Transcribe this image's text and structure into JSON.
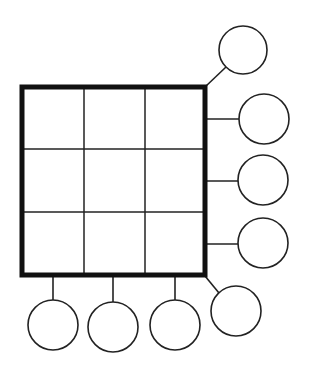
{
  "diagram": {
    "type": "magic-square-puzzle-template",
    "colors": {
      "background": "#ffffff",
      "stroke": "#222222",
      "border": "#111111"
    },
    "grid": {
      "rows": 3,
      "cols": 3,
      "x": 22,
      "y": 87,
      "width": 183,
      "height": 188,
      "border_width": 5,
      "line_width": 1.5,
      "col_lines_x": [
        84,
        145
      ],
      "row_lines_y": [
        149,
        212
      ],
      "cells": [
        [
          "",
          "",
          ""
        ],
        [
          "",
          "",
          ""
        ],
        [
          "",
          "",
          ""
        ]
      ]
    },
    "sum_circles": [
      {
        "id": "diagonal-top",
        "label": "",
        "cx": 243,
        "cy": 50,
        "r": 24,
        "connector": {
          "x1": 205,
          "y1": 87,
          "x2": 226,
          "y2": 67
        }
      },
      {
        "id": "row-1",
        "label": "",
        "cx": 264,
        "cy": 119,
        "r": 25,
        "connector": {
          "x1": 205,
          "y1": 119,
          "x2": 239,
          "y2": 119
        }
      },
      {
        "id": "row-2",
        "label": "",
        "cx": 263,
        "cy": 180,
        "r": 25,
        "connector": {
          "x1": 205,
          "y1": 181,
          "x2": 238,
          "y2": 181
        }
      },
      {
        "id": "row-3",
        "label": "",
        "cx": 263,
        "cy": 243,
        "r": 25,
        "connector": {
          "x1": 205,
          "y1": 244,
          "x2": 238,
          "y2": 244
        }
      },
      {
        "id": "diagonal-bottom",
        "label": "",
        "cx": 236,
        "cy": 311,
        "r": 25,
        "connector": {
          "x1": 205,
          "y1": 276,
          "x2": 219,
          "y2": 293
        }
      },
      {
        "id": "col-1",
        "label": "",
        "cx": 53,
        "cy": 325,
        "r": 25,
        "connector": {
          "x1": 53,
          "y1": 277,
          "x2": 53,
          "y2": 300
        }
      },
      {
        "id": "col-2",
        "label": "",
        "cx": 113,
        "cy": 327,
        "r": 25,
        "connector": {
          "x1": 113,
          "y1": 277,
          "x2": 113,
          "y2": 302
        }
      },
      {
        "id": "col-3",
        "label": "",
        "cx": 175,
        "cy": 325,
        "r": 25,
        "connector": {
          "x1": 175,
          "y1": 277,
          "x2": 175,
          "y2": 300
        }
      }
    ]
  }
}
